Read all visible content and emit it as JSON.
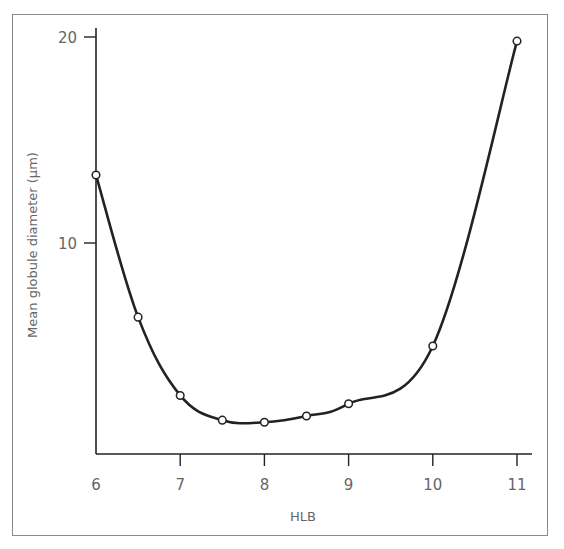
{
  "chart_data": {
    "type": "line",
    "title": "",
    "xlabel": "HLB",
    "ylabel": "Mean globule diameter (µm)",
    "x": [
      6,
      6.5,
      7,
      7.5,
      8,
      8.5,
      9,
      10,
      11
    ],
    "series": [
      {
        "name": "Mean globule diameter",
        "values": [
          13.3,
          6.4,
          2.6,
          1.4,
          1.3,
          1.6,
          2.2,
          5.0,
          19.8
        ]
      }
    ],
    "x_ticks": [
      "6",
      "7",
      "8",
      "9",
      "10",
      "11"
    ],
    "y_ticks": [
      "10",
      "20"
    ],
    "xlim": [
      6,
      11.2
    ],
    "ylim": [
      0,
      20
    ],
    "grid": false,
    "legend": false,
    "markers": "open-circle"
  },
  "labels": {
    "xlabel": "HLB",
    "ylabel": "Mean globule diameter (µm)",
    "x_ticks": [
      "6",
      "7",
      "8",
      "9",
      "10",
      "11"
    ],
    "y_ticks": [
      "20",
      "10"
    ]
  }
}
